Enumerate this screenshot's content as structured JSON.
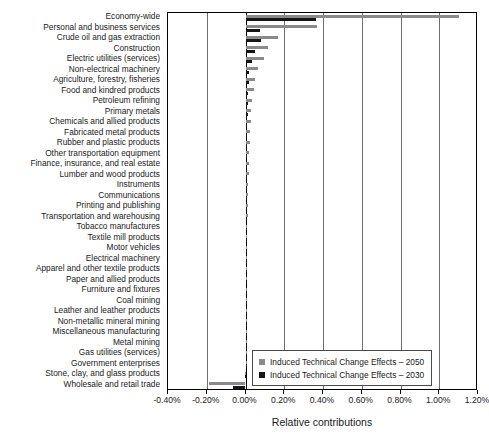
{
  "chart_data": {
    "type": "bar",
    "orientation": "horizontal",
    "title": "",
    "xlabel": "Relative contributions",
    "ylabel": "",
    "xlim": [
      -0.4,
      1.2
    ],
    "xticks": [
      "-0.40%",
      "-0.20%",
      "0.00%",
      "0.20%",
      "0.40%",
      "0.60%",
      "0.80%",
      "1.00%",
      "1.20%"
    ],
    "xtick_values": [
      -0.4,
      -0.2,
      0.0,
      0.2,
      0.4,
      0.6,
      0.8,
      1.0,
      1.2
    ],
    "grid": true,
    "legend_position": "bottom-right",
    "categories": [
      "Economy-wide",
      "Personal and business services",
      "Crude oil and gas extraction",
      "Construction",
      "Electric utilities (services)",
      "Non-electrical machinery",
      "Agriculture, forestry, fisheries",
      "Food and kindred products",
      "Petroleum refining",
      "Primary metals",
      "Chemicals and allied products",
      "Fabricated metal products",
      "Rubber and plastic products",
      "Other transportation equipment",
      "Finance, insurance, and real estate",
      "Lumber and wood products",
      "Instruments",
      "Communications",
      "Printing and publishing",
      "Transportation and warehousing",
      "Tobacco manufactures",
      "Textile mill products",
      "Motor vehicles",
      "Electrical machinery",
      "Apparel and other textile products",
      "Paper and allied products",
      "Furniture and fixtures",
      "Coal mining",
      "Leather and leather products",
      "Non-metallic mineral mining",
      "Miscellaneous manufacturing",
      "Metal mining",
      "Gas utilities (services)",
      "Government enterprises",
      "Stone, clay, and glass products",
      "Wholesale and retail trade"
    ],
    "series": [
      {
        "name": "Induced Technical Change Effects – 2050",
        "color": "#8a8a8a",
        "values": [
          1.1,
          0.368,
          0.166,
          0.118,
          0.093,
          0.062,
          0.05,
          0.042,
          0.034,
          0.03,
          0.027,
          0.024,
          0.021,
          0.019,
          0.017,
          0.016,
          0.014,
          0.013,
          0.012,
          0.011,
          0.01,
          0.009,
          0.009,
          0.008,
          0.007,
          0.007,
          0.006,
          0.005,
          0.005,
          0.004,
          0.004,
          0.003,
          0.003,
          0.002,
          -0.004,
          -0.188
        ]
      },
      {
        "name": "Induced Technical Change Effects – 2030",
        "color": "#161616",
        "values": [
          0.366,
          0.073,
          0.082,
          0.047,
          0.031,
          0.019,
          0.016,
          0.014,
          0.012,
          0.011,
          0.01,
          0.01,
          0.009,
          0.008,
          0.008,
          0.007,
          0.007,
          0.006,
          0.006,
          0.005,
          0.005,
          0.005,
          0.004,
          0.004,
          0.004,
          0.003,
          0.003,
          0.003,
          0.002,
          0.002,
          0.002,
          0.002,
          0.001,
          0.001,
          -0.002,
          -0.064
        ]
      }
    ]
  },
  "legend": {
    "entries": [
      "Induced Technical Change Effects – 2050",
      "Induced Technical Change Effects – 2030"
    ]
  }
}
